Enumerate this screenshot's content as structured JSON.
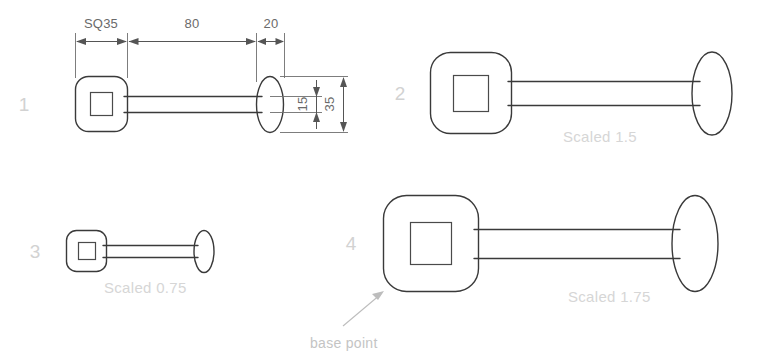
{
  "drawing": {
    "title": "Scaled block diagram comparison",
    "stroke_color": "#3a3a3a",
    "dimension_color": "#6a6a6a",
    "caption_color": "#d6d6d6",
    "figure_number_color": "#d2d2d2",
    "annotation_color": "#c4c4c4",
    "background": "#ffffff"
  },
  "dimensions": {
    "head_width": "SQ35",
    "shank_length": "80",
    "end_length": "20",
    "shank_height": "15",
    "overall_height": "35"
  },
  "figures": [
    {
      "number": "1",
      "caption": "",
      "scale": 1.0,
      "dimensioned": true
    },
    {
      "number": "2",
      "caption": "Scaled 1.5",
      "scale": 1.5,
      "dimensioned": false
    },
    {
      "number": "3",
      "caption": "Scaled 0.75",
      "scale": 0.75,
      "dimensioned": false
    },
    {
      "number": "4",
      "caption": "Scaled 1.75",
      "scale": 1.75,
      "dimensioned": false
    }
  ],
  "annotations": [
    {
      "label": "base point",
      "points_to": "figure-4-head-lower-left-corner"
    }
  ]
}
